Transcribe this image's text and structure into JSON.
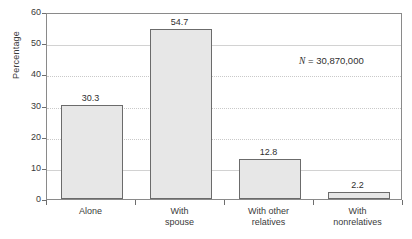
{
  "chart_data": {
    "type": "bar",
    "title": "",
    "subtitle": "",
    "xlabel": "",
    "ylabel": "Percentage",
    "ylim": [
      0,
      60
    ],
    "ytick_values": [
      0,
      10,
      20,
      30,
      40,
      50,
      60
    ],
    "ytick_labels": [
      "0",
      "10",
      "20",
      "30",
      "40",
      "50",
      "60"
    ],
    "grid": true,
    "grid_axis": "y",
    "legend": "none",
    "categories": [
      "Alone",
      "With spouse",
      "With other relatives",
      "With nonrelatives"
    ],
    "category_label_lines": [
      [
        "Alone"
      ],
      [
        "With",
        "spouse"
      ],
      [
        "With other",
        "relatives"
      ],
      [
        "With",
        "nonrelatives"
      ]
    ],
    "values": [
      30.3,
      54.7,
      12.8,
      2.2
    ],
    "value_labels": [
      "30.3",
      "54.7",
      "12.8",
      "2.2"
    ],
    "annotations": [
      {
        "symbol": "N",
        "text": " = 30,870,000",
        "full_text": "N = 30,870,000"
      }
    ],
    "colors": {
      "bar_fill": "#e7e7e7",
      "bar_border": "#6b6b6b",
      "gridline": "#c9c9c9",
      "axis": "#8a8a8a",
      "text": "#2f2f2f",
      "background": "#ffffff"
    }
  }
}
